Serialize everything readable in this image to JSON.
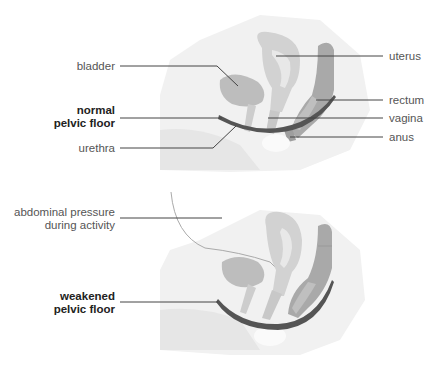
{
  "diagrams": [
    {
      "name": "normal",
      "labels_left": {
        "bladder": "bladder",
        "pelvic_floor_line1": "normal",
        "pelvic_floor_line2": "pelvic floor",
        "urethra": "urethra"
      },
      "labels_right": {
        "uterus": "uterus",
        "rectum": "rectum",
        "vagina": "vagina",
        "anus": "anus"
      }
    },
    {
      "name": "weakened",
      "labels_left": {
        "pressure_line1": "abdominal pressure",
        "pressure_line2": "during activity",
        "pelvic_floor_line1": "weakened",
        "pelvic_floor_line2": "pelvic floor"
      }
    }
  ],
  "colors": {
    "pelvic_floor": "#555555",
    "organ": "#b8b8b8",
    "organ_light": "#d4d4d4",
    "body": "#ececec",
    "leader": "#444444",
    "text": "#555555"
  }
}
